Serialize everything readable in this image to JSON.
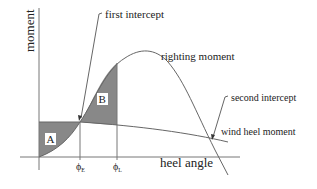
{
  "diagram": {
    "axes": {
      "y_label": "moment",
      "x_label": "heel angle"
    },
    "curves": {
      "righting": "righting moment",
      "wind": "wind heel moment"
    },
    "annotations": {
      "first_intercept": "first intercept",
      "second_intercept": "second intercept"
    },
    "areas": {
      "a": "A",
      "b": "B"
    },
    "ticks": {
      "phi_e": "ϕ",
      "phi_e_sub": "E",
      "phi_l": "ϕ",
      "phi_l_sub": "L"
    },
    "colors": {
      "fill": "#888888",
      "line": "#555555",
      "text": "#222222"
    }
  }
}
